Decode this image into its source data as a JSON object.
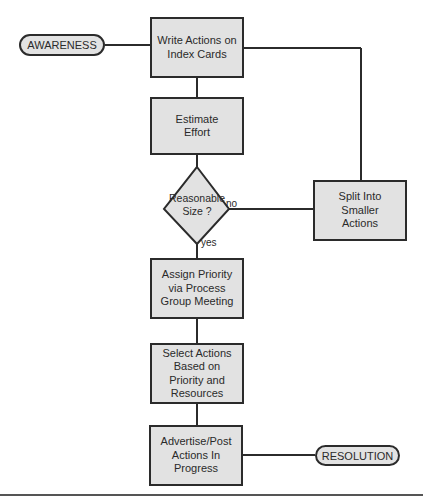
{
  "terminals": {
    "start": "AWARENESS",
    "end": "RESOLUTION"
  },
  "steps": [
    {
      "id": "write-actions",
      "label": "Write Actions on Index Cards"
    },
    {
      "id": "estimate-effort",
      "label": "Estimate Effort"
    },
    {
      "id": "assign-priority",
      "label": "Assign Priority via Process Group Meeting"
    },
    {
      "id": "select-actions",
      "label": "Select Actions Based on Priority and Resources"
    },
    {
      "id": "advertise-post",
      "label": "Advertise/Post Actions In Progress"
    },
    {
      "id": "split-actions",
      "label": "Split Into Smaller Actions"
    }
  ],
  "decision": {
    "label": "Reasonable Size ?",
    "yes_label": "yes",
    "no_label": "no"
  },
  "colors": {
    "box_fill": "#e2e2e2",
    "stroke": "#2b2b2b"
  }
}
